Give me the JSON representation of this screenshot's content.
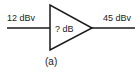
{
  "diagram": {
    "type": "amplifier-block",
    "input": {
      "label": "12 dBv"
    },
    "amplifier": {
      "gain_label": "? dB"
    },
    "output": {
      "label": "45 dBv"
    },
    "caption": "(a)",
    "colors": {
      "stroke": "#1a1a1a",
      "background": "#ffffff"
    }
  }
}
